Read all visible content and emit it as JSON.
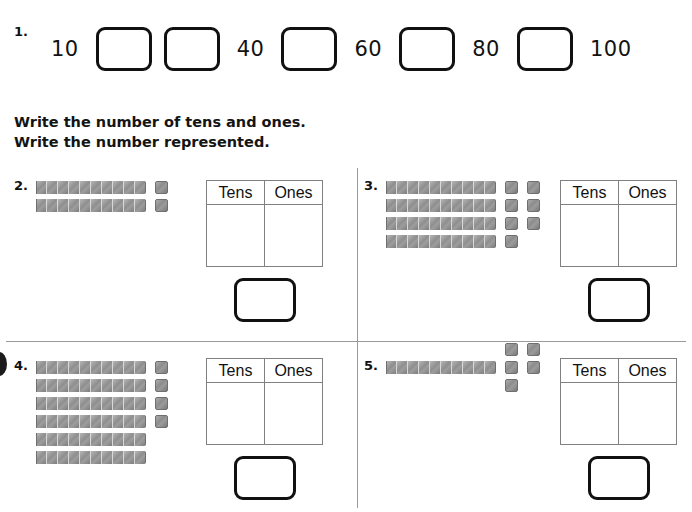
{
  "worksheet": {
    "sequence_exercise": {
      "number": "1.",
      "items": [
        {
          "type": "number",
          "value": "10"
        },
        {
          "type": "blank"
        },
        {
          "type": "blank"
        },
        {
          "type": "number",
          "value": "40"
        },
        {
          "type": "blank"
        },
        {
          "type": "number",
          "value": "60"
        },
        {
          "type": "blank"
        },
        {
          "type": "number",
          "value": "80"
        },
        {
          "type": "blank"
        },
        {
          "type": "number",
          "value": "100"
        }
      ]
    },
    "instructions": {
      "line1": "Write the number of tens and ones.",
      "line2": "Write the number represented."
    },
    "table_headers": {
      "tens": "Tens",
      "ones": "Ones"
    },
    "problems": [
      {
        "number": "2.",
        "tens_rods": 2,
        "ones_cubes": 2,
        "ones_layout": [
          1,
          1
        ],
        "tens_value": "",
        "ones_value": "",
        "answer": ""
      },
      {
        "number": "3.",
        "tens_rods": 4,
        "ones_cubes": 7,
        "ones_layout": [
          2,
          2,
          2,
          1
        ],
        "tens_value": "",
        "ones_value": "",
        "answer": ""
      },
      {
        "number": "4.",
        "tens_rods": 6,
        "ones_cubes": 4,
        "ones_layout": [
          1,
          1,
          1,
          1
        ],
        "tens_value": "",
        "ones_value": "",
        "answer": ""
      },
      {
        "number": "5.",
        "tens_rods": 1,
        "ones_cubes": 5,
        "ones_layout": [
          2,
          2,
          1
        ],
        "tens_value": "",
        "ones_value": "",
        "answer": ""
      }
    ]
  }
}
